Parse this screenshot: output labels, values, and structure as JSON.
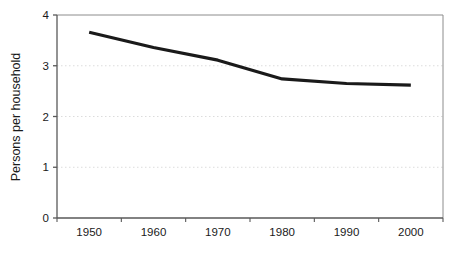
{
  "chart_data": {
    "type": "line",
    "title": "",
    "xlabel": "",
    "ylabel": "Persons per household",
    "categories": [
      "1950",
      "1960",
      "1970",
      "1980",
      "1990",
      "2000"
    ],
    "values": [
      3.66,
      3.36,
      3.11,
      2.74,
      2.65,
      2.62
    ],
    "series": [
      {
        "name": "Persons per household",
        "values": [
          3.66,
          3.36,
          3.11,
          2.74,
          2.65,
          2.62
        ]
      }
    ],
    "ylim": [
      0,
      4
    ],
    "yticks": [
      "0",
      "1",
      "2",
      "3",
      "4"
    ],
    "ytick_values": [
      0,
      1,
      2,
      3,
      4
    ],
    "xticks": [
      "1950",
      "1960",
      "1970",
      "1980",
      "1990",
      "2000"
    ],
    "grid": "horizontal-dotted",
    "legend": "none",
    "line_color": "#1a1a1a",
    "grid_color": "#dcdcdc",
    "axis_color": "#595959",
    "plot_background": "#ffffff"
  },
  "figure": {
    "background": "#ffffff"
  }
}
